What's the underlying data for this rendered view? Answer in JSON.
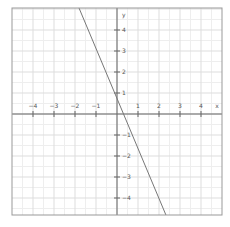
{
  "chart_data": {
    "type": "line",
    "title": "",
    "xlabel": "x",
    "ylabel": "y",
    "xlim": [
      -4.95,
      5.05
    ],
    "ylim": [
      -4.85,
      5.05
    ],
    "grid": true,
    "x_ticks": [
      -4,
      -3,
      -2,
      -1,
      1,
      2,
      3,
      4
    ],
    "y_ticks": [
      4,
      3,
      2,
      1,
      -1,
      -2,
      -3,
      -4
    ],
    "x_tick_labels": [
      "−4",
      "−3",
      "−2",
      "−1",
      "1",
      "2",
      "3",
      "4"
    ],
    "y_tick_labels": [
      "4",
      "3",
      "2",
      "1",
      "−1",
      "−2",
      "−3",
      "−4"
    ],
    "series": [
      {
        "name": "line",
        "x": [
          -1.81,
          2.33
        ],
        "y": [
          5.05,
          -4.81
        ],
        "slope": -2.38,
        "intercept": 0.7
      }
    ],
    "legend": "none"
  },
  "colors": {
    "background": "#ffffff",
    "frame": "#999999",
    "axis": "#666666",
    "grid_major": "#dddddd",
    "grid_minor": "#eeeeee",
    "line": "#777777",
    "tick_label": "#555555"
  },
  "layout": {
    "frame": {
      "left": 12,
      "top": 8,
      "right": 222,
      "bottom": 215
    },
    "origin": {
      "x": 117,
      "y": 114
    },
    "unit_px": 21
  }
}
